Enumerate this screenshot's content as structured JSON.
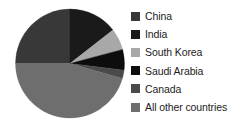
{
  "chart_data": {
    "type": "pie",
    "title": "",
    "subtitle": "",
    "xlabel": "",
    "ylabel": "",
    "grid": false,
    "legend_position": "right",
    "start_angle_deg": 0,
    "direction": "clockwise",
    "categories": [
      "China",
      "India",
      "South Korea",
      "Saudi Arabia",
      "Canada",
      "All other countries"
    ],
    "values": [
      25.0,
      14.5,
      6.5,
      6.0,
      2.5,
      45.5
    ],
    "colors": [
      "#383838",
      "#1a1a1a",
      "#a8a8a8",
      "#0d0d0d",
      "#4a4a4a",
      "#6e6e6e"
    ],
    "slices": [
      {
        "label": "China",
        "value": 25.0,
        "color": "#383838",
        "start_deg": 270,
        "end_deg": 360
      },
      {
        "label": "India",
        "value": 14.5,
        "color": "#1a1a1a",
        "start_deg": 0,
        "end_deg": 52
      },
      {
        "label": "South Korea",
        "value": 6.5,
        "color": "#a8a8a8",
        "start_deg": 52,
        "end_deg": 75
      },
      {
        "label": "Saudi Arabia",
        "value": 6.0,
        "color": "#0d0d0d",
        "start_deg": 75,
        "end_deg": 97
      },
      {
        "label": "Canada",
        "value": 2.5,
        "color": "#4a4a4a",
        "start_deg": 97,
        "end_deg": 106
      },
      {
        "label": "All other countries",
        "value": 45.5,
        "color": "#6e6e6e",
        "start_deg": 106,
        "end_deg": 270
      }
    ],
    "annotations": []
  },
  "legend": {
    "items": [
      {
        "label": "China",
        "color": "#383838",
        "swatch_name": "legend-swatch-china"
      },
      {
        "label": "India",
        "color": "#1a1a1a",
        "swatch_name": "legend-swatch-india"
      },
      {
        "label": "South Korea",
        "color": "#a8a8a8",
        "swatch_name": "legend-swatch-south-korea"
      },
      {
        "label": "Saudi Arabia",
        "color": "#0d0d0d",
        "swatch_name": "legend-swatch-saudi-arabia"
      },
      {
        "label": "Canada",
        "color": "#4a4a4a",
        "swatch_name": "legend-swatch-canada"
      },
      {
        "label": "All other countries",
        "color": "#6e6e6e",
        "swatch_name": "legend-swatch-all-other-countries"
      }
    ]
  },
  "figure": {
    "background_color": "#ffffff",
    "text_color": "#1c1c1c"
  }
}
